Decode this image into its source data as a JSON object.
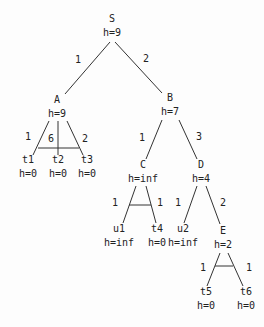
{
  "diagram": {
    "type": "and-or-tree",
    "nodes": [
      {
        "id": "S",
        "label": "S",
        "h": "h=9",
        "x": 112,
        "y": 19
      },
      {
        "id": "A",
        "label": "A",
        "h": "h=9",
        "x": 57,
        "y": 100
      },
      {
        "id": "B",
        "label": "B",
        "h": "h=7",
        "x": 170,
        "y": 98
      },
      {
        "id": "t1",
        "label": "t1",
        "h": "h=0",
        "x": 28,
        "y": 160
      },
      {
        "id": "t2",
        "label": "t2",
        "h": "h=0",
        "x": 58,
        "y": 160
      },
      {
        "id": "t3",
        "label": "t3",
        "h": "h=0",
        "x": 87,
        "y": 160
      },
      {
        "id": "C",
        "label": "C",
        "h": "h=inf",
        "x": 143,
        "y": 165
      },
      {
        "id": "D",
        "label": "D",
        "h": "h=4",
        "x": 201,
        "y": 165
      },
      {
        "id": "u1",
        "label": "u1",
        "h": "h=inf",
        "x": 119,
        "y": 229
      },
      {
        "id": "t4",
        "label": "t4",
        "h": "h=0",
        "x": 157,
        "y": 229
      },
      {
        "id": "u2",
        "label": "u2",
        "h": "h=inf",
        "x": 183,
        "y": 229
      },
      {
        "id": "E",
        "label": "E",
        "h": "h=2",
        "x": 223,
        "y": 231
      },
      {
        "id": "t5",
        "label": "t5",
        "h": "h=0",
        "x": 206,
        "y": 292
      },
      {
        "id": "t6",
        "label": "t6",
        "h": "h=0",
        "x": 246,
        "y": 292
      }
    ],
    "edges": [
      {
        "from": "S",
        "to": "A",
        "cost": "1",
        "x1": 110,
        "y1": 42,
        "x2": 65,
        "y2": 94,
        "lx": 78,
        "ly": 60
      },
      {
        "from": "S",
        "to": "B",
        "cost": "2",
        "x1": 115,
        "y1": 42,
        "x2": 162,
        "y2": 93,
        "lx": 146,
        "ly": 59
      },
      {
        "from": "A",
        "to": "t1",
        "cost": "1",
        "x1": 49,
        "y1": 121,
        "x2": 33,
        "y2": 155,
        "lx": 28,
        "ly": 137
      },
      {
        "from": "A",
        "to": "t2",
        "cost": "6",
        "x1": 58,
        "y1": 121,
        "x2": 58,
        "y2": 155,
        "lx": 51,
        "ly": 139
      },
      {
        "from": "A",
        "to": "t3",
        "cost": "2",
        "x1": 67,
        "y1": 121,
        "x2": 83,
        "y2": 155,
        "lx": 85,
        "ly": 139
      },
      {
        "from": "B",
        "to": "C",
        "cost": "1",
        "x1": 162,
        "y1": 120,
        "x2": 146,
        "y2": 159,
        "lx": 142,
        "ly": 138
      },
      {
        "from": "B",
        "to": "D",
        "cost": "3",
        "x1": 179,
        "y1": 120,
        "x2": 197,
        "y2": 159,
        "lx": 199,
        "ly": 137
      },
      {
        "from": "C",
        "to": "u1",
        "cost": "1",
        "x1": 136,
        "y1": 186,
        "x2": 123,
        "y2": 223,
        "lx": 115,
        "ly": 203
      },
      {
        "from": "C",
        "to": "t4",
        "cost": "1",
        "x1": 146,
        "y1": 186,
        "x2": 156,
        "y2": 223,
        "lx": 160,
        "ly": 203
      },
      {
        "from": "D",
        "to": "u2",
        "cost": "1",
        "x1": 197,
        "y1": 186,
        "x2": 184,
        "y2": 223,
        "lx": 178,
        "ly": 203
      },
      {
        "from": "D",
        "to": "E",
        "cost": "2",
        "x1": 206,
        "y1": 186,
        "x2": 220,
        "y2": 224,
        "lx": 223,
        "ly": 203
      },
      {
        "from": "E",
        "to": "t5",
        "cost": "1",
        "x1": 220,
        "y1": 253,
        "x2": 207,
        "y2": 286,
        "lx": 203,
        "ly": 268
      },
      {
        "from": "E",
        "to": "t6",
        "cost": "1",
        "x1": 228,
        "y1": 253,
        "x2": 243,
        "y2": 286,
        "lx": 249,
        "ly": 268
      }
    ],
    "and_arcs": [
      {
        "node": "A",
        "x1": 38,
        "y1": 148,
        "x2": 79,
        "y2": 148
      },
      {
        "node": "C",
        "x1": 129,
        "y1": 205,
        "x2": 151,
        "y2": 205
      },
      {
        "node": "E",
        "x1": 215,
        "y1": 266,
        "x2": 233,
        "y2": 266
      }
    ]
  }
}
